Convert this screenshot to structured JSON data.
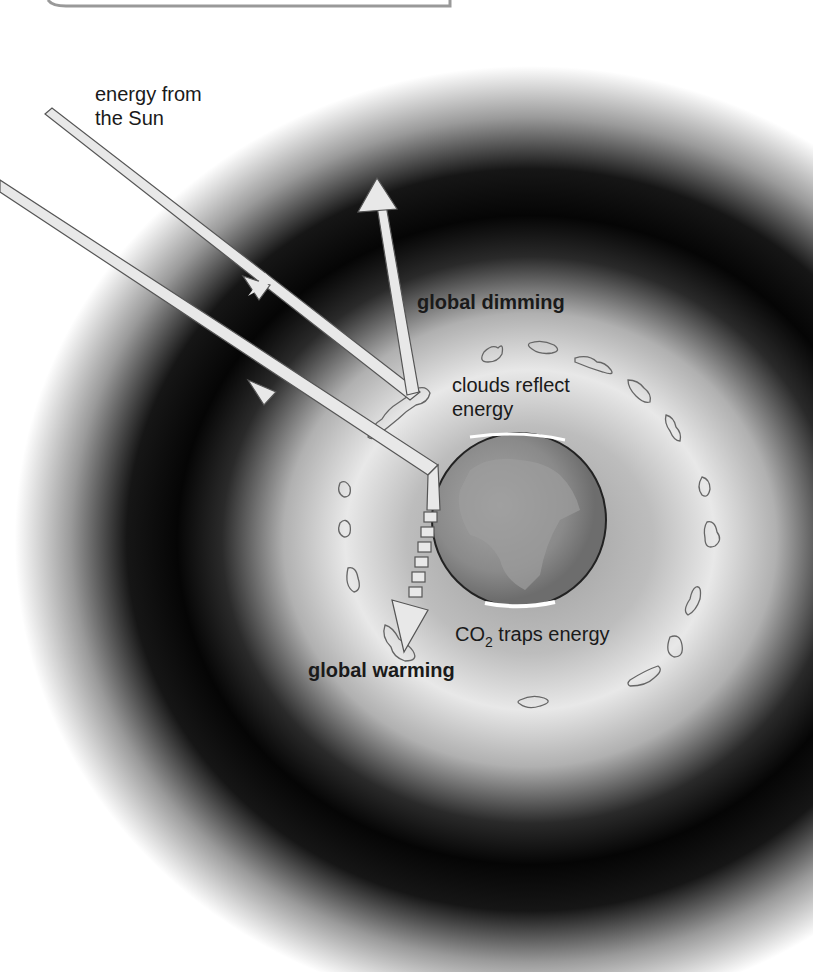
{
  "diagram": {
    "labels": {
      "sun_energy_line1": "energy from",
      "sun_energy_line2": "the Sun",
      "global_dimming": "global dimming",
      "clouds_line1": "clouds reflect",
      "clouds_line2": "energy",
      "co2_prefix": "CO",
      "co2_subscript": "2",
      "co2_suffix": " traps energy",
      "global_warming": "global warming"
    },
    "colors": {
      "background": "#ffffff",
      "atmosphere_dark": "#050505",
      "atmosphere_light": "#eeeeee",
      "arrow_fill": "#e8e8e8",
      "arrow_stroke": "#555555",
      "earth": "#8a8a8a",
      "cloud_stroke": "#666666",
      "text": "#1a1a1a"
    }
  }
}
